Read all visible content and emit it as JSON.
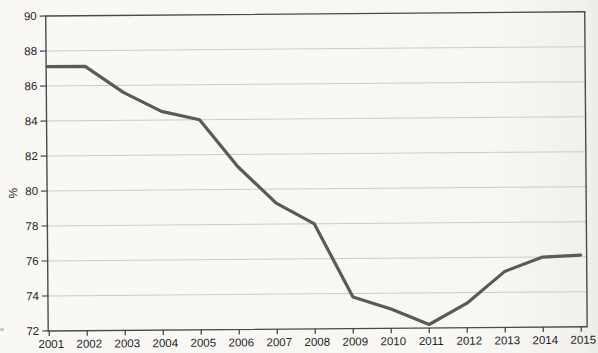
{
  "chart_data": {
    "type": "line",
    "title": "",
    "xlabel": "",
    "ylabel": "%",
    "x": [
      2001,
      2002,
      2003,
      2004,
      2005,
      2006,
      2007,
      2008,
      2009,
      2010,
      2011,
      2012,
      2013,
      2014,
      2015
    ],
    "series": [
      {
        "name": "percentage",
        "values": [
          87.1,
          87.1,
          85.6,
          84.5,
          84.0,
          81.3,
          79.2,
          78.0,
          73.8,
          73.1,
          72.2,
          73.4,
          75.2,
          76.0,
          76.1
        ]
      }
    ],
    "ylim": [
      72,
      90
    ],
    "ytick_step": 2,
    "grid": "horizontal",
    "legend": "none",
    "colors": {
      "line": "#5a5a5a",
      "grid": "#cbcbc8",
      "frame": "#4a4a4a",
      "axis": "#3a3a3a",
      "tick": "#3a3a3a",
      "text": "#1e1e1e",
      "background": "#f9f8f5"
    }
  }
}
